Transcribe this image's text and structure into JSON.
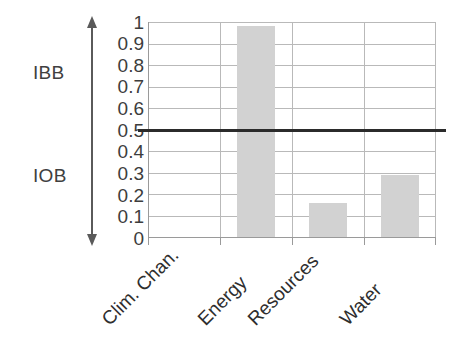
{
  "chart_data": {
    "type": "bar",
    "title": "",
    "subtitle": "",
    "xlabel": "",
    "ylabel": "",
    "categories": [
      "Clim. Chan.",
      "Energy",
      "Resources",
      "Water"
    ],
    "values": [
      0,
      0.98,
      0.16,
      0.29
    ],
    "series": [
      {
        "name": "score",
        "values": [
          0,
          0.98,
          0.16,
          0.29
        ],
        "color": "#d2d2d2"
      }
    ],
    "ylim": [
      0,
      1
    ],
    "xlim_categories": 4,
    "y_ticks": [
      0,
      0.1,
      0.2,
      0.3,
      0.4,
      0.5,
      0.6,
      0.7,
      0.8,
      0.9,
      1
    ],
    "y_tick_labels": [
      "0",
      "0.1",
      "0.2",
      "0.3",
      "0.4",
      "0.5",
      "0.6",
      "0.7",
      "0.8",
      "0.9",
      "1"
    ],
    "grid": true,
    "grid_axis": "both",
    "legend": false,
    "legend_position": "none",
    "annotations": [
      {
        "name": "threshold-line",
        "type": "hline",
        "value": 0.5,
        "color": "#2b2b2b",
        "label": ""
      },
      {
        "name": "ibb-range",
        "type": "arrow-range",
        "label": "IBB",
        "from": 0.5,
        "to": 1.0,
        "direction": "up",
        "color": "#5a5a5a"
      },
      {
        "name": "iob-range",
        "type": "arrow-range",
        "label": "IOB",
        "from": 0.5,
        "to": 0.0,
        "direction": "down",
        "color": "#5a5a5a"
      }
    ],
    "colors": {
      "bar_fill": "#d2d2d2",
      "gridline": "#b9b9b9",
      "axis": "#9a9a9a",
      "threshold": "#2b2b2b",
      "text": "#3a3a3a",
      "arrow": "#5a5a5a",
      "background": "#ffffff"
    }
  },
  "axis": {
    "y_labels": [
      "1",
      "0.9",
      "0.8",
      "0.7",
      "0.6",
      "0.5",
      "0.4",
      "0.3",
      "0.2",
      "0.1",
      "0"
    ]
  },
  "annotations": {
    "upper_label": "IBB",
    "lower_label": "IOB"
  }
}
